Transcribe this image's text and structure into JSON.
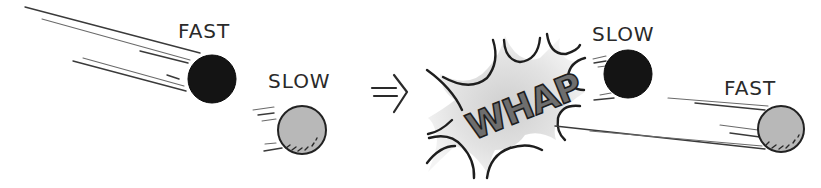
{
  "diagram": {
    "type": "comic-illustration",
    "before": {
      "balls": [
        {
          "id": "black-ball",
          "color": "#141414",
          "speed_label": "FAST"
        },
        {
          "id": "gray-ball",
          "color": "#b8b8b8",
          "speed_label": "SLOW"
        }
      ]
    },
    "transition": {
      "arrow_symbol": "⇒"
    },
    "impact": {
      "sound_effect": "WHAP",
      "burst_fill": "#d9d9d9",
      "text_color": "#6e6e6e"
    },
    "after": {
      "balls": [
        {
          "id": "black-ball",
          "color": "#141414",
          "speed_label": "SLOW"
        },
        {
          "id": "gray-ball",
          "color": "#b8b8b8",
          "speed_label": "FAST"
        }
      ]
    }
  }
}
